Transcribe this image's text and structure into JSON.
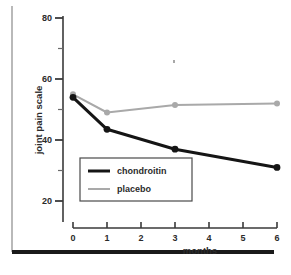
{
  "figure": {
    "name": "joint-pain-scale-line-chart",
    "background_color": "#ffffff"
  },
  "chart_data": {
    "type": "line",
    "title": "",
    "xlabel": "months",
    "ylabel": "joint pain scale",
    "x": [
      0,
      1,
      3,
      6
    ],
    "xlim": [
      0,
      6
    ],
    "ylim": [
      14,
      80
    ],
    "grid": false,
    "legend_position": "inside-lower-left",
    "x_ticks": [
      "0",
      "1",
      "2",
      "3",
      "4",
      "5",
      "6"
    ],
    "x_tick_values": [
      0,
      1,
      2,
      3,
      4,
      5,
      6
    ],
    "y_ticks": [
      "80",
      "60",
      "40",
      "20"
    ],
    "y_tick_values": [
      80,
      60,
      40,
      20
    ],
    "y_minor_tick_values": [
      70,
      50,
      30
    ],
    "series": [
      {
        "name": "chondroitin",
        "color": "#151515",
        "line_width": 3,
        "marker": "circle",
        "values": [
          54,
          43.5,
          37,
          31
        ]
      },
      {
        "name": "placebo",
        "color": "#a9a9a9",
        "line_width": 2,
        "marker": "circle",
        "values": [
          55,
          49,
          51.5,
          52
        ]
      }
    ]
  },
  "legend": {
    "entries": [
      {
        "label": "chondroitin",
        "color": "#151515",
        "line_width": 3
      },
      {
        "label": "placebo",
        "color": "#a9a9a9",
        "line_width": 2
      }
    ]
  },
  "decorations": {
    "left_rule_color": "#b9b9b9",
    "bottom_rule_color": "#1a1a1a"
  }
}
